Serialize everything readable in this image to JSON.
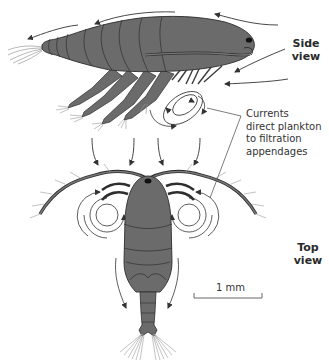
{
  "figure": {
    "labels": {
      "side_view": {
        "line1": "Side",
        "line2": "view"
      },
      "top_view": {
        "line1": "Top",
        "line2": "view"
      },
      "annotation": {
        "line1": "Currents",
        "line2": "direct plankton",
        "line3": "to filtration",
        "line4": "appendages"
      },
      "scale_bar": "1 mm"
    },
    "colors": {
      "body_fill": "#6b6b6b",
      "outline": "#2e2e2e",
      "arrow": "#333333",
      "setae": "#9a9a9a"
    }
  }
}
